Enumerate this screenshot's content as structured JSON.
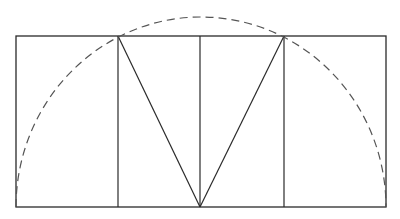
{
  "diagram": {
    "colors": {
      "line": "#2a2a2a",
      "dashed": "#555555",
      "background": "#ffffff"
    },
    "rectangle": {
      "x1": 16,
      "y1": 36,
      "x2": 386,
      "y2": 207
    },
    "verticals": [
      118,
      200,
      284
    ],
    "triangle_lines": [
      {
        "x1": 118,
        "y1": 36,
        "x2": 200,
        "y2": 207
      },
      {
        "x1": 200,
        "y1": 207,
        "x2": 284,
        "y2": 36
      }
    ],
    "semicircle": {
      "cx": 200,
      "cy": 207,
      "rx": 185,
      "ry": 190,
      "dashed": true
    }
  }
}
